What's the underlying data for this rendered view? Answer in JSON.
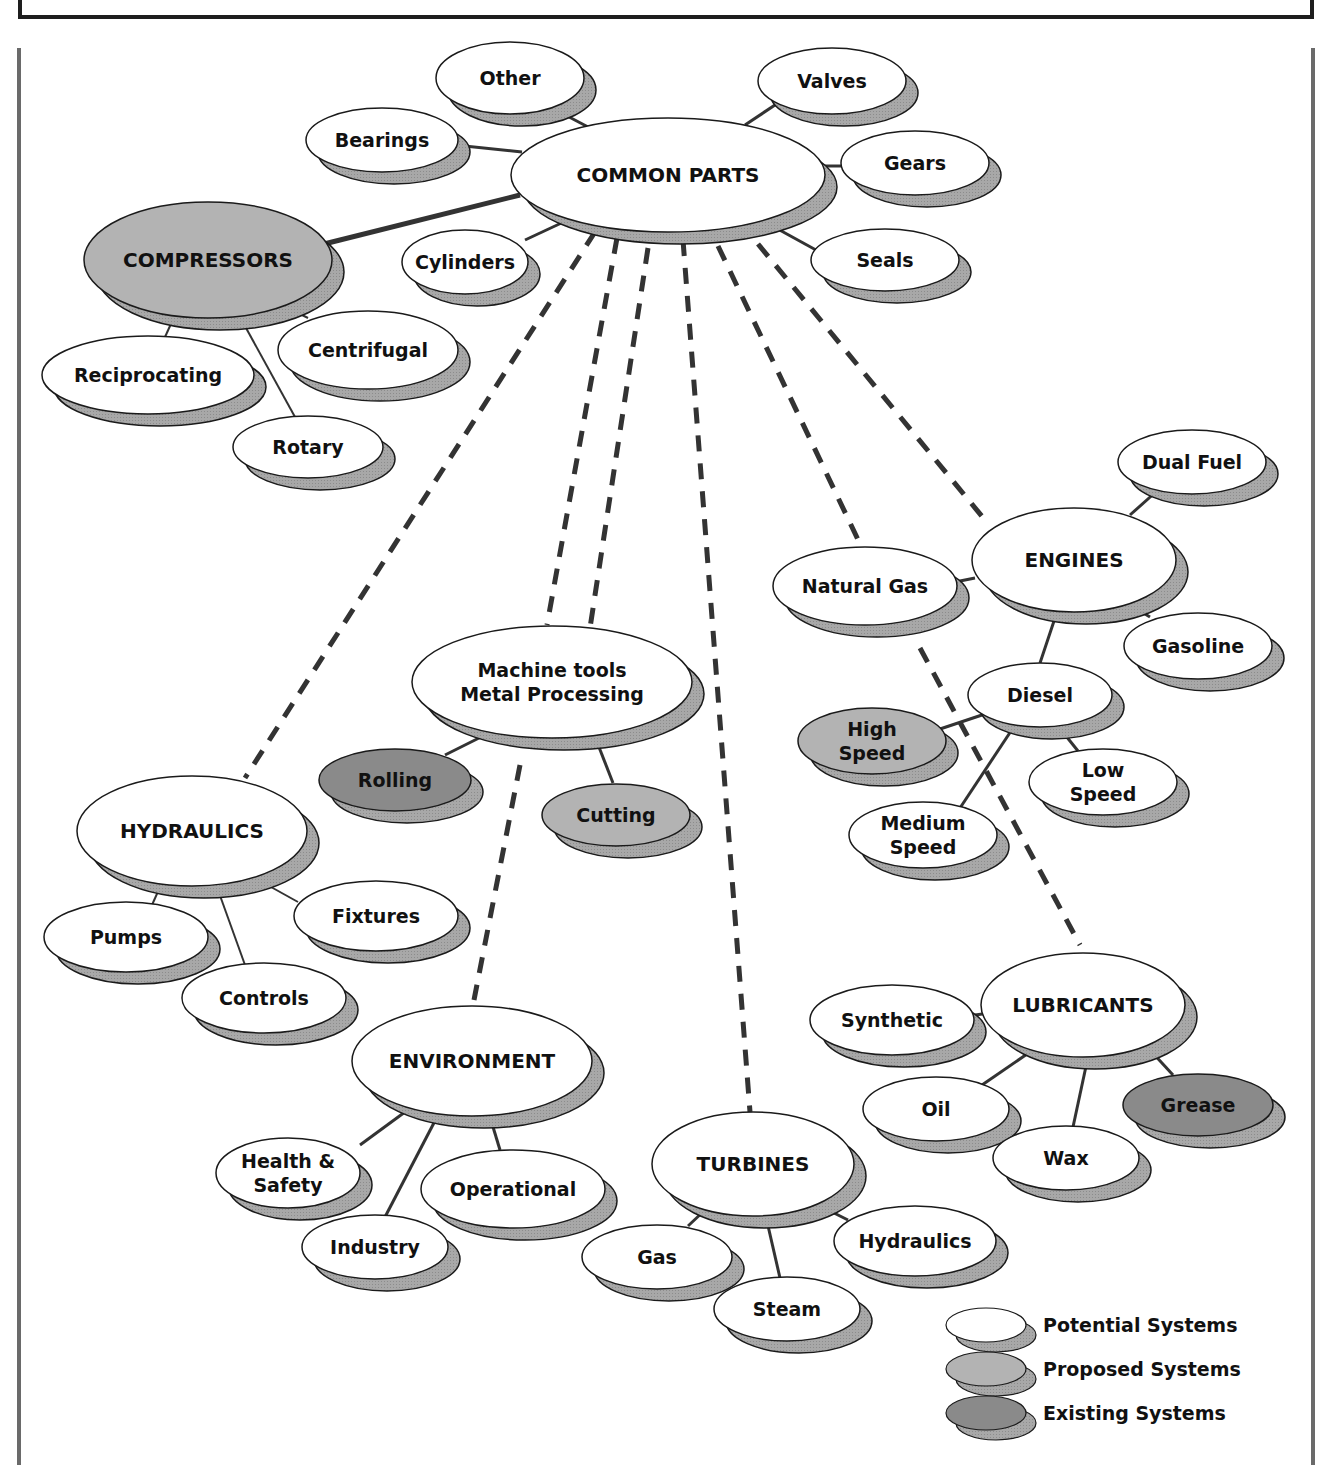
{
  "colors": {
    "potential": "#ffffff",
    "proposed": "#b3b3b3",
    "existing": "#8a8a8a",
    "shadow": "#a8a8a8",
    "outline": "#1a1a1a",
    "line": "#333333"
  },
  "nodes": [
    {
      "id": "common",
      "label": [
        "COMMON PARTS"
      ],
      "cx": 668,
      "cy": 175,
      "rx": 157,
      "ry": 57,
      "type": "potential",
      "size": 20
    },
    {
      "id": "other",
      "label": [
        "Other"
      ],
      "cx": 510,
      "cy": 78,
      "rx": 74,
      "ry": 36,
      "type": "potential",
      "size": 19
    },
    {
      "id": "valves",
      "label": [
        "Valves"
      ],
      "cx": 832,
      "cy": 81,
      "rx": 74,
      "ry": 33,
      "type": "potential",
      "size": 19
    },
    {
      "id": "bearings",
      "label": [
        "Bearings"
      ],
      "cx": 382,
      "cy": 140,
      "rx": 76,
      "ry": 32,
      "type": "potential",
      "size": 19
    },
    {
      "id": "gears",
      "label": [
        "Gears"
      ],
      "cx": 915,
      "cy": 163,
      "rx": 74,
      "ry": 32,
      "type": "potential",
      "size": 19
    },
    {
      "id": "compressors",
      "label": [
        "COMPRESSORS"
      ],
      "cx": 208,
      "cy": 260,
      "rx": 124,
      "ry": 58,
      "type": "proposed",
      "size": 20
    },
    {
      "id": "cylinders",
      "label": [
        "Cylinders"
      ],
      "cx": 465,
      "cy": 262,
      "rx": 63,
      "ry": 32,
      "type": "potential",
      "size": 19
    },
    {
      "id": "seals",
      "label": [
        "Seals"
      ],
      "cx": 885,
      "cy": 260,
      "rx": 74,
      "ry": 31,
      "type": "potential",
      "size": 19
    },
    {
      "id": "centrifugal",
      "label": [
        "Centrifugal"
      ],
      "cx": 368,
      "cy": 350,
      "rx": 90,
      "ry": 39,
      "type": "potential",
      "size": 19
    },
    {
      "id": "reciprocating",
      "label": [
        "Reciprocating"
      ],
      "cx": 148,
      "cy": 375,
      "rx": 106,
      "ry": 39,
      "type": "potential",
      "size": 19
    },
    {
      "id": "rotary",
      "label": [
        "Rotary"
      ],
      "cx": 308,
      "cy": 447,
      "rx": 75,
      "ry": 31,
      "type": "potential",
      "size": 19
    },
    {
      "id": "dualfuel",
      "label": [
        "Dual Fuel"
      ],
      "cx": 1192,
      "cy": 462,
      "rx": 74,
      "ry": 32,
      "type": "potential",
      "size": 19
    },
    {
      "id": "engines",
      "label": [
        "ENGINES"
      ],
      "cx": 1074,
      "cy": 560,
      "rx": 102,
      "ry": 52,
      "type": "potential",
      "size": 20
    },
    {
      "id": "naturalgas",
      "label": [
        "Natural Gas"
      ],
      "cx": 865,
      "cy": 586,
      "rx": 92,
      "ry": 39,
      "type": "potential",
      "size": 19
    },
    {
      "id": "gasoline",
      "label": [
        "Gasoline"
      ],
      "cx": 1198,
      "cy": 646,
      "rx": 74,
      "ry": 33,
      "type": "potential",
      "size": 19
    },
    {
      "id": "machinetools",
      "label": [
        "Machine tools",
        "Metal Processing"
      ],
      "cx": 552,
      "cy": 682,
      "rx": 140,
      "ry": 56,
      "type": "potential",
      "size": 19
    },
    {
      "id": "diesel",
      "label": [
        "Diesel"
      ],
      "cx": 1040,
      "cy": 695,
      "rx": 72,
      "ry": 32,
      "type": "potential",
      "size": 19
    },
    {
      "id": "highspeed",
      "label": [
        "High",
        "Speed"
      ],
      "cx": 872,
      "cy": 741,
      "rx": 74,
      "ry": 33,
      "type": "proposed",
      "size": 19
    },
    {
      "id": "rolling",
      "label": [
        "Rolling"
      ],
      "cx": 395,
      "cy": 780,
      "rx": 76,
      "ry": 31,
      "type": "existing",
      "size": 19
    },
    {
      "id": "lowspeed",
      "label": [
        "Low",
        "Speed"
      ],
      "cx": 1103,
      "cy": 782,
      "rx": 74,
      "ry": 33,
      "type": "potential",
      "size": 19
    },
    {
      "id": "cutting",
      "label": [
        "Cutting"
      ],
      "cx": 616,
      "cy": 815,
      "rx": 74,
      "ry": 31,
      "type": "proposed",
      "size": 19
    },
    {
      "id": "mediumspeed",
      "label": [
        "Medium",
        "Speed"
      ],
      "cx": 923,
      "cy": 835,
      "rx": 74,
      "ry": 33,
      "type": "potential",
      "size": 19
    },
    {
      "id": "hydraulics",
      "label": [
        "HYDRAULICS"
      ],
      "cx": 192,
      "cy": 831,
      "rx": 115,
      "ry": 55,
      "type": "potential",
      "size": 20
    },
    {
      "id": "fixtures",
      "label": [
        "Fixtures"
      ],
      "cx": 376,
      "cy": 916,
      "rx": 82,
      "ry": 35,
      "type": "potential",
      "size": 19
    },
    {
      "id": "pumps",
      "label": [
        "Pumps"
      ],
      "cx": 126,
      "cy": 937,
      "rx": 82,
      "ry": 35,
      "type": "potential",
      "size": 19
    },
    {
      "id": "controls",
      "label": [
        "Controls"
      ],
      "cx": 264,
      "cy": 998,
      "rx": 82,
      "ry": 35,
      "type": "potential",
      "size": 19
    },
    {
      "id": "lubricants",
      "label": [
        "LUBRICANTS"
      ],
      "cx": 1083,
      "cy": 1005,
      "rx": 102,
      "ry": 52,
      "type": "potential",
      "size": 20
    },
    {
      "id": "synthetic",
      "label": [
        "Synthetic"
      ],
      "cx": 892,
      "cy": 1020,
      "rx": 82,
      "ry": 35,
      "type": "potential",
      "size": 19
    },
    {
      "id": "environment",
      "label": [
        "ENVIRONMENT"
      ],
      "cx": 472,
      "cy": 1061,
      "rx": 120,
      "ry": 55,
      "type": "potential",
      "size": 20
    },
    {
      "id": "oil",
      "label": [
        "Oil"
      ],
      "cx": 936,
      "cy": 1109,
      "rx": 73,
      "ry": 32,
      "type": "potential",
      "size": 19
    },
    {
      "id": "grease",
      "label": [
        "Grease"
      ],
      "cx": 1198,
      "cy": 1105,
      "rx": 75,
      "ry": 31,
      "type": "existing",
      "size": 19
    },
    {
      "id": "wax",
      "label": [
        "Wax"
      ],
      "cx": 1066,
      "cy": 1158,
      "rx": 73,
      "ry": 32,
      "type": "potential",
      "size": 19
    },
    {
      "id": "turbines",
      "label": [
        "TURBINES"
      ],
      "cx": 753,
      "cy": 1164,
      "rx": 101,
      "ry": 52,
      "type": "potential",
      "size": 20
    },
    {
      "id": "healthsafety",
      "label": [
        "Health &",
        "Safety"
      ],
      "cx": 288,
      "cy": 1173,
      "rx": 72,
      "ry": 35,
      "type": "potential",
      "size": 19
    },
    {
      "id": "operational",
      "label": [
        "Operational"
      ],
      "cx": 513,
      "cy": 1189,
      "rx": 92,
      "ry": 39,
      "type": "potential",
      "size": 19
    },
    {
      "id": "industry",
      "label": [
        "Industry"
      ],
      "cx": 375,
      "cy": 1247,
      "rx": 73,
      "ry": 32,
      "type": "potential",
      "size": 19
    },
    {
      "id": "hydraulics2",
      "label": [
        "Hydraulics"
      ],
      "cx": 915,
      "cy": 1241,
      "rx": 81,
      "ry": 35,
      "type": "potential",
      "size": 19
    },
    {
      "id": "gas",
      "label": [
        "Gas"
      ],
      "cx": 657,
      "cy": 1257,
      "rx": 75,
      "ry": 32,
      "type": "potential",
      "size": 19
    },
    {
      "id": "steam",
      "label": [
        "Steam"
      ],
      "cx": 787,
      "cy": 1309,
      "rx": 73,
      "ry": 32,
      "type": "potential",
      "size": 19
    }
  ],
  "solid_links": [
    {
      "x1": 522,
      "y1": 152,
      "x2": 455,
      "y2": 145,
      "w": 3
    },
    {
      "x1": 590,
      "y1": 128,
      "x2": 552,
      "y2": 108,
      "w": 3
    },
    {
      "x1": 745,
      "y1": 125,
      "x2": 778,
      "y2": 103,
      "w": 3
    },
    {
      "x1": 823,
      "y1": 166,
      "x2": 845,
      "y2": 166,
      "w": 3
    },
    {
      "x1": 765,
      "y1": 222,
      "x2": 816,
      "y2": 250,
      "w": 3
    },
    {
      "x1": 570,
      "y1": 219,
      "x2": 525,
      "y2": 240,
      "w": 3
    },
    {
      "x1": 520,
      "y1": 195,
      "x2": 320,
      "y2": 245,
      "w": 5
    },
    {
      "x1": 175,
      "y1": 315,
      "x2": 165,
      "y2": 337,
      "w": 2
    },
    {
      "x1": 240,
      "y1": 317,
      "x2": 295,
      "y2": 417,
      "w": 2
    },
    {
      "x1": 282,
      "y1": 305,
      "x2": 308,
      "y2": 318,
      "w": 2
    },
    {
      "x1": 1130,
      "y1": 515,
      "x2": 1158,
      "y2": 490,
      "w": 3
    },
    {
      "x1": 975,
      "y1": 578,
      "x2": 955,
      "y2": 582,
      "w": 3
    },
    {
      "x1": 1130,
      "y1": 605,
      "x2": 1150,
      "y2": 617,
      "w": 3
    },
    {
      "x1": 1057,
      "y1": 612,
      "x2": 1040,
      "y2": 663,
      "w": 3
    },
    {
      "x1": 982,
      "y1": 715,
      "x2": 940,
      "y2": 729,
      "w": 3
    },
    {
      "x1": 1015,
      "y1": 725,
      "x2": 960,
      "y2": 808,
      "w": 3
    },
    {
      "x1": 1058,
      "y1": 726,
      "x2": 1078,
      "y2": 751,
      "w": 3
    },
    {
      "x1": 483,
      "y1": 736,
      "x2": 445,
      "y2": 755,
      "w": 3
    },
    {
      "x1": 597,
      "y1": 742,
      "x2": 613,
      "y2": 783,
      "w": 3
    },
    {
      "x1": 160,
      "y1": 887,
      "x2": 152,
      "y2": 905,
      "w": 2
    },
    {
      "x1": 218,
      "y1": 890,
      "x2": 245,
      "y2": 965,
      "w": 2
    },
    {
      "x1": 262,
      "y1": 882,
      "x2": 298,
      "y2": 902,
      "w": 2
    },
    {
      "x1": 990,
      "y1": 1013,
      "x2": 975,
      "y2": 1015,
      "w": 3
    },
    {
      "x1": 1030,
      "y1": 1052,
      "x2": 982,
      "y2": 1085,
      "w": 3
    },
    {
      "x1": 1088,
      "y1": 1057,
      "x2": 1073,
      "y2": 1127,
      "w": 3
    },
    {
      "x1": 1150,
      "y1": 1050,
      "x2": 1173,
      "y2": 1075,
      "w": 3
    },
    {
      "x1": 405,
      "y1": 1112,
      "x2": 360,
      "y2": 1145,
      "w": 3
    },
    {
      "x1": 437,
      "y1": 1117,
      "x2": 385,
      "y2": 1217,
      "w": 3
    },
    {
      "x1": 490,
      "y1": 1117,
      "x2": 500,
      "y2": 1150,
      "w": 3
    },
    {
      "x1": 705,
      "y1": 1210,
      "x2": 688,
      "y2": 1226,
      "w": 3
    },
    {
      "x1": 766,
      "y1": 1217,
      "x2": 780,
      "y2": 1278,
      "w": 3
    },
    {
      "x1": 820,
      "y1": 1206,
      "x2": 848,
      "y2": 1220,
      "w": 3
    }
  ],
  "dashed_links": [
    {
      "x1": 595,
      "y1": 232,
      "x2": 245,
      "y2": 778
    },
    {
      "x1": 617,
      "y1": 238,
      "x2": 547,
      "y2": 625
    },
    {
      "x1": 648,
      "y1": 248,
      "x2": 590,
      "y2": 628
    },
    {
      "x1": 683,
      "y1": 240,
      "x2": 750,
      "y2": 1112
    },
    {
      "x1": 718,
      "y1": 246,
      "x2": 862,
      "y2": 548
    },
    {
      "x1": 758,
      "y1": 244,
      "x2": 985,
      "y2": 520
    },
    {
      "x1": 520,
      "y1": 765,
      "x2": 474,
      "y2": 1000
    },
    {
      "x1": 920,
      "y1": 648,
      "x2": 1080,
      "y2": 945
    }
  ],
  "legend": {
    "items": [
      {
        "label": "Potential Systems",
        "type": "potential",
        "y": 1325
      },
      {
        "label": "Proposed Systems",
        "type": "proposed",
        "y": 1369
      },
      {
        "label": "Existing Systems",
        "type": "existing",
        "y": 1413
      }
    ]
  }
}
